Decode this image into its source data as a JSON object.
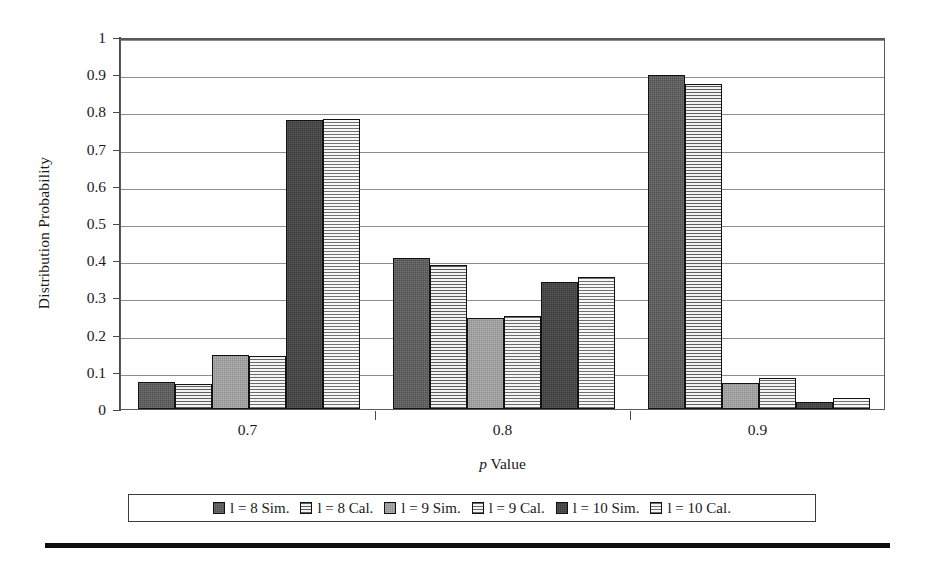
{
  "chart_data": {
    "type": "bar",
    "title": "",
    "xlabel": "p Value",
    "xlabel_italic_prefix": "p",
    "xlabel_rest": " Value",
    "ylabel": "Distribution Probability",
    "categories": [
      "0.7",
      "0.8",
      "0.9"
    ],
    "ylim": [
      0,
      1
    ],
    "yticks": [
      "0",
      "0.1",
      "0.2",
      "0.3",
      "0.4",
      "0.5",
      "0.6",
      "0.7",
      "0.8",
      "0.9",
      "1"
    ],
    "ytick_values": [
      0,
      0.1,
      0.2,
      0.3,
      0.4,
      0.5,
      0.6,
      0.7,
      0.8,
      0.9,
      1
    ],
    "grid": true,
    "grid_axis": "y",
    "legend_position": "bottom",
    "series": [
      {
        "name": "l = 8 Sim.",
        "fill": "s1",
        "color": "#4f4f4f",
        "values": [
          0.072,
          0.405,
          0.898
        ]
      },
      {
        "name": "l = 8 Cal.",
        "fill": "s2",
        "color": "#ececec",
        "values": [
          0.068,
          0.386,
          0.875
        ]
      },
      {
        "name": "l = 9 Sim.",
        "fill": "s3",
        "color": "#8f8f8f",
        "values": [
          0.146,
          0.245,
          0.071
        ]
      },
      {
        "name": "l = 9 Cal.",
        "fill": "s4",
        "color": "#eeeeee",
        "values": [
          0.143,
          0.249,
          0.083
        ]
      },
      {
        "name": "l = 10 Sim.",
        "fill": "s5",
        "color": "#3a3a3a",
        "values": [
          0.778,
          0.341,
          0.02
        ]
      },
      {
        "name": "l = 10 Cal.",
        "fill": "s6",
        "color": "#f0f0f0",
        "values": [
          0.78,
          0.354,
          0.029
        ]
      }
    ]
  },
  "legend": {
    "entries": [
      {
        "label": "l = 8 Sim."
      },
      {
        "label": "l = 8 Cal."
      },
      {
        "label": "l = 9 Sim."
      },
      {
        "label": "l = 9 Cal."
      },
      {
        "label": "l = 10 Sim."
      },
      {
        "label": "l = 10 Cal."
      }
    ]
  }
}
